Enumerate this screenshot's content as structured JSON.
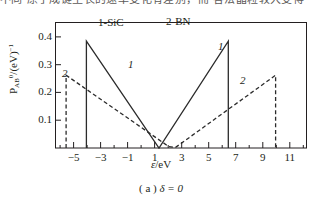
{
  "top_running_text": "不同 原子成键生长的速率变化有差别，而 各法晶粒较大变得",
  "caption": {
    "index": "( a )",
    "condition": "δ = 0"
  },
  "axes": {
    "x_title_symbol": "ε",
    "x_title_unit": "/eV",
    "y_title_main": "P",
    "y_title_sub": "AB",
    "y_title_sup": "0",
    "y_title_tail": "/(eV)",
    "y_title_tail_sup": "−1",
    "x_tick_labels": [
      "−5",
      "−3",
      "−1",
      "1",
      "3",
      "5",
      "7",
      "9",
      "11"
    ],
    "y_tick_labels": [
      "0.1",
      "0.2",
      "0.3",
      "0.4"
    ]
  },
  "legend": {
    "item_1": "1-SiC",
    "item_2": "2-BN"
  },
  "annotations": {
    "curve1_left": "1",
    "curve1_right": "1",
    "curve2_left": "2",
    "curve2_right": "2"
  },
  "colors": {
    "axis": "#231f20",
    "curve1": "#2b2b2b",
    "curve2": "#2b2b2b",
    "background": "#ffffff"
  },
  "chart_data": {
    "type": "line",
    "title": "",
    "xlabel": "ε/eV",
    "ylabel": "P(0,AB)/(eV)^-1",
    "xlim": [
      -6.3,
      12.2
    ],
    "ylim": [
      0,
      0.45
    ],
    "grid": false,
    "legend_position": "top-center",
    "x_ticks_major": [
      -5,
      -3,
      -1,
      1,
      3,
      5,
      7,
      9,
      11
    ],
    "x_ticks_minor": [
      -6,
      -4,
      -2,
      0,
      2,
      4,
      6,
      8,
      10,
      12
    ],
    "y_ticks_major": [
      0.1,
      0.2,
      0.3,
      0.4
    ],
    "series": [
      {
        "name": "1-SiC",
        "style": "solid",
        "points": [
          [
            -4.05,
            0.0
          ],
          [
            -4.05,
            0.385
          ],
          [
            1.32,
            0.0
          ],
          [
            6.45,
            0.385
          ],
          [
            6.45,
            0.0
          ]
        ]
      },
      {
        "name": "2-BN",
        "style": "dashed",
        "points": [
          [
            -5.55,
            0.0
          ],
          [
            -5.55,
            0.262
          ],
          [
            2.05,
            0.005
          ],
          [
            2.55,
            0.002
          ],
          [
            9.95,
            0.262
          ],
          [
            9.95,
            0.0
          ]
        ]
      }
    ]
  }
}
